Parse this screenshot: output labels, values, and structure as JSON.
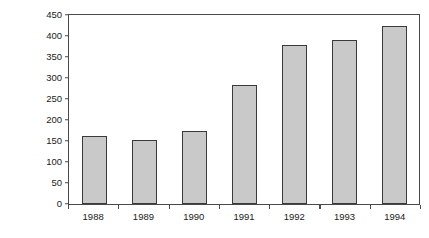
{
  "chart_data": {
    "type": "bar",
    "title": "",
    "xlabel": "",
    "ylabel": "Number of Crimes",
    "categories": [
      "1988",
      "1989",
      "1990",
      "1991",
      "1992",
      "1993",
      "1994"
    ],
    "values": [
      162,
      152,
      174,
      283,
      378,
      390,
      424
    ],
    "series": [
      {
        "name": "Number of Crimes",
        "values": [
          162,
          152,
          174,
          283,
          378,
          390,
          424
        ]
      }
    ],
    "ylim": [
      0,
      450
    ],
    "ytick_step": 50,
    "yticks": [
      0,
      50,
      100,
      150,
      200,
      250,
      300,
      350,
      400,
      450
    ],
    "ytick_labels": [
      "0",
      "50",
      "100",
      "150",
      "200",
      "250",
      "300",
      "350",
      "400",
      "450"
    ],
    "grid": false,
    "legend": false,
    "legend_position": "none",
    "bar_fill_color": "#c9c9c9",
    "bar_border_color": "#3a3a3a",
    "axis_color": "#4a4a4a",
    "background_color": "#ffffff",
    "text_color": "#1a1a1a"
  }
}
